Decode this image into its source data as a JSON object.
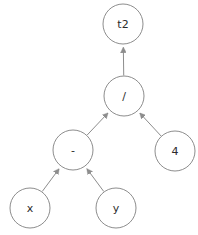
{
  "diagram": {
    "type": "expression-tree",
    "expression": "t2 = (x - y) / 4",
    "background_color": "#ffffff",
    "stroke_color": "#8d8d8d",
    "text_color": "#2b2b2b",
    "node_radius": 20,
    "nodes": [
      {
        "id": "t2",
        "label": "t2",
        "role": "result",
        "cx": 123,
        "cy": 24
      },
      {
        "id": "div",
        "label": "/",
        "role": "operator",
        "cx": 124,
        "cy": 96
      },
      {
        "id": "sub",
        "label": "-",
        "role": "operator",
        "cx": 73,
        "cy": 150
      },
      {
        "id": "four",
        "label": "4",
        "role": "constant",
        "cx": 175,
        "cy": 151
      },
      {
        "id": "x",
        "label": "x",
        "role": "variable",
        "cx": 30,
        "cy": 208
      },
      {
        "id": "y",
        "label": "y",
        "role": "variable",
        "cx": 116,
        "cy": 208
      }
    ],
    "edges": [
      {
        "from": "x",
        "to": "sub",
        "arrow": "up"
      },
      {
        "from": "y",
        "to": "sub",
        "arrow": "up"
      },
      {
        "from": "sub",
        "to": "div",
        "arrow": "up"
      },
      {
        "from": "four",
        "to": "div",
        "arrow": "up"
      },
      {
        "from": "div",
        "to": "t2",
        "arrow": "up"
      }
    ]
  }
}
